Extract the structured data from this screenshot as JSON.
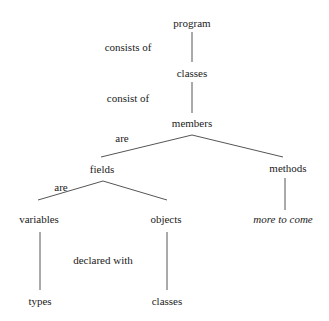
{
  "diagram": {
    "nodes": [
      {
        "id": "program",
        "label": "program",
        "x": 192,
        "y": 23
      },
      {
        "id": "classes1",
        "label": "classes",
        "x": 192,
        "y": 73
      },
      {
        "id": "members",
        "label": "members",
        "x": 192,
        "y": 123
      },
      {
        "id": "fields",
        "label": "fields",
        "x": 102,
        "y": 169
      },
      {
        "id": "methods",
        "label": "methods",
        "x": 288,
        "y": 168
      },
      {
        "id": "variables",
        "label": "variables",
        "x": 39,
        "y": 219
      },
      {
        "id": "objects",
        "label": "objects",
        "x": 166,
        "y": 219
      },
      {
        "id": "more",
        "label": "more to come",
        "x": 283,
        "y": 219,
        "italic": true
      },
      {
        "id": "types",
        "label": "types",
        "x": 40,
        "y": 301
      },
      {
        "id": "classes2",
        "label": "classes",
        "x": 167,
        "y": 301
      }
    ],
    "edge_labels": [
      {
        "label": "consists of",
        "x": 128,
        "y": 47
      },
      {
        "label": "consist of",
        "x": 128,
        "y": 98
      },
      {
        "label": "are",
        "x": 122,
        "y": 138
      },
      {
        "label": "are",
        "x": 61,
        "y": 187
      },
      {
        "label": "declared with",
        "x": 103,
        "y": 260
      }
    ],
    "edges": [
      {
        "x1": 192,
        "y1": 32,
        "x2": 192,
        "y2": 62
      },
      {
        "x1": 192,
        "y1": 82,
        "x2": 192,
        "y2": 113
      },
      {
        "x1": 192,
        "y1": 135,
        "x2": 101,
        "y2": 157
      },
      {
        "x1": 192,
        "y1": 135,
        "x2": 283,
        "y2": 157
      },
      {
        "x1": 103,
        "y1": 181,
        "x2": 38,
        "y2": 200
      },
      {
        "x1": 103,
        "y1": 181,
        "x2": 167,
        "y2": 200
      },
      {
        "x1": 285,
        "y1": 178,
        "x2": 285,
        "y2": 210
      },
      {
        "x1": 40,
        "y1": 232,
        "x2": 40,
        "y2": 290
      },
      {
        "x1": 167,
        "y1": 232,
        "x2": 167,
        "y2": 290
      }
    ],
    "line_color": "#555555"
  }
}
